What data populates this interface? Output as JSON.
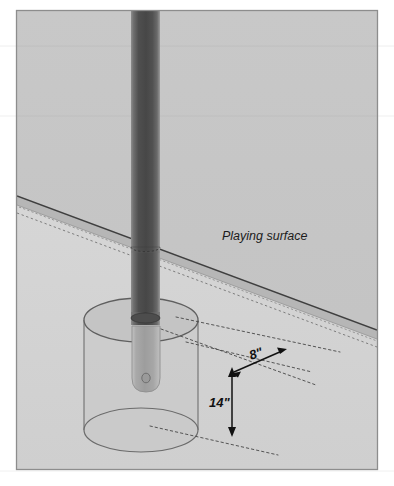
{
  "figure": {
    "canvas": {
      "width": 394,
      "height": 486
    },
    "background_color": "#ffffff",
    "frame": {
      "name": "illustration-frame",
      "x": 16,
      "y": 10,
      "width": 362,
      "height": 460,
      "stroke_color": "#8a8a8a",
      "fill_color": "#c9c9c9"
    },
    "labels": {
      "playing_surface": "Playing surface",
      "offset_dimension": "8\"",
      "depth_dimension": "14\""
    },
    "colors": {
      "upper_background": "#c6c6c6",
      "lower_background": "#d3d3d3",
      "surface_band_top": "#bdbdbd",
      "surface_band_face": "#b4b4b4",
      "pole_dark": "#4a4a4a",
      "pole_mid": "#5e5e5e",
      "pole_light": "#8e8e8e",
      "sleeve_fill": "#b3b3b3",
      "cylinder_fill": "#c4c4c4",
      "outline": "#6b6b6b",
      "dotted_line": "#5a5a5a",
      "arrow": "#111111",
      "text": "#1c1c1c"
    },
    "geometry": {
      "pole": {
        "left": 131,
        "right": 160,
        "top": 10,
        "bottom": 325,
        "width": 29
      },
      "sleeve": {
        "left": 132,
        "right": 160,
        "top": 325,
        "bottom": 392
      },
      "outer_cylinder": {
        "center_x": 141,
        "top_ellipse_cy": 320,
        "bottom_ellipse_cy": 430,
        "rx": 57,
        "ry": 22
      },
      "surface_band": {
        "left_y": 196,
        "right_y": 330,
        "thickness": 9
      }
    },
    "annotations": [
      {
        "name": "playing-surface-label",
        "text": "Playing surface",
        "x": 222,
        "y": 240,
        "style": "italic"
      },
      {
        "name": "offset-dimension-label",
        "text": "8\"",
        "x": 251,
        "y": 362,
        "style": "italic-bold",
        "rotation": -16
      },
      {
        "name": "depth-dimension-label",
        "text": "14\"",
        "x": 210,
        "y": 404,
        "style": "italic-bold",
        "rotation": 0
      }
    ],
    "dimension_arrows": [
      {
        "name": "offset-arrow-8in",
        "label": "8\"",
        "type": "double-headed",
        "orientation": "diagonal",
        "from": {
          "x": 232,
          "y": 372
        },
        "to": {
          "x": 285,
          "y": 350
        }
      },
      {
        "name": "depth-arrow-14in",
        "label": "14\"",
        "type": "double-headed",
        "orientation": "vertical",
        "from": {
          "x": 232,
          "y": 370
        },
        "to": {
          "x": 232,
          "y": 433
        }
      }
    ],
    "leader_lines": [
      {
        "name": "leader-sleeve-top",
        "from": {
          "x": 160,
          "y": 330
        },
        "to": {
          "x": 300,
          "y": 373
        }
      },
      {
        "name": "leader-surface-level",
        "from": {
          "x": 172,
          "y": 318
        },
        "to": {
          "x": 330,
          "y": 345
        }
      },
      {
        "name": "leader-cylinder-bottom",
        "from": {
          "x": 150,
          "y": 425
        },
        "to": {
          "x": 272,
          "y": 450
        }
      }
    ]
  }
}
